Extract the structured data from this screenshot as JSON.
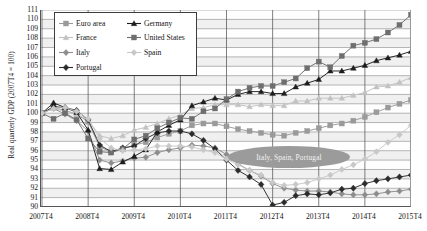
{
  "chart_data": {
    "type": "line",
    "title": "",
    "xlabel": "",
    "ylabel": "Real quarterly GDP (2007T4 = 100)",
    "ylim": [
      90,
      111
    ],
    "ytick_labels": [
      "90",
      "91",
      "92",
      "93",
      "94",
      "95",
      "96",
      "97",
      "98",
      "99",
      "100",
      "101",
      "102",
      "103",
      "104",
      "105",
      "106",
      "107",
      "108",
      "109",
      "110",
      "111"
    ],
    "xtick_labels": [
      "2007T4",
      "2008T4",
      "2009T4",
      "2010T4",
      "2011T4",
      "2012T4",
      "2013T4",
      "2014T4",
      "2015T4"
    ],
    "x_start_label": "2007T4",
    "x_end_label": "2015T4",
    "grid": true,
    "legend_position": "top-left-inside",
    "x_quarters": [
      "2007T4",
      "2008T1",
      "2008T2",
      "2008T3",
      "2008T4",
      "2009T1",
      "2009T2",
      "2009T3",
      "2009T4",
      "2010T1",
      "2010T2",
      "2010T3",
      "2010T4",
      "2011T1",
      "2011T2",
      "2011T3",
      "2011T4",
      "2012T1",
      "2012T2",
      "2012T3",
      "2012T4",
      "2013T1",
      "2013T2",
      "2013T3",
      "2013T4",
      "2014T1",
      "2014T2",
      "2014T3",
      "2014T4",
      "2015T1",
      "2015T2",
      "2015T3",
      "2015T4"
    ],
    "series": [
      {
        "name": "Euro area",
        "color": "#9a9a9a",
        "marker": "square",
        "values": [
          100.0,
          100.6,
          100.3,
          99.9,
          99.1,
          96.4,
          95.9,
          96.2,
          96.6,
          96.9,
          97.4,
          97.8,
          98.1,
          98.7,
          98.9,
          98.9,
          98.6,
          98.3,
          98.1,
          97.9,
          97.7,
          97.6,
          97.9,
          98.1,
          98.4,
          98.7,
          98.9,
          99.2,
          99.6,
          100.1,
          100.6,
          101.0,
          101.4
        ]
      },
      {
        "name": "France",
        "color": "#c2c2c2",
        "marker": "triangle",
        "values": [
          100.0,
          100.5,
          100.2,
          99.9,
          99.3,
          97.6,
          97.3,
          97.6,
          98.2,
          98.5,
          98.9,
          99.4,
          99.8,
          100.5,
          100.6,
          100.9,
          100.9,
          100.9,
          100.7,
          100.9,
          100.8,
          100.8,
          101.3,
          101.3,
          101.6,
          101.6,
          101.6,
          101.9,
          102.2,
          102.8,
          102.9,
          103.3,
          103.8
        ]
      },
      {
        "name": "Italy",
        "color": "#8d8d8d",
        "marker": "diamond",
        "values": [
          100.0,
          100.5,
          99.9,
          99.2,
          98.1,
          95.0,
          94.7,
          94.9,
          95.2,
          95.3,
          95.8,
          96.1,
          96.3,
          96.6,
          96.5,
          96.3,
          95.6,
          94.6,
          93.9,
          93.3,
          92.5,
          92.0,
          91.8,
          91.7,
          91.7,
          91.6,
          91.4,
          91.3,
          91.3,
          91.4,
          91.6,
          91.7,
          91.9
        ]
      },
      {
        "name": "Portugal",
        "color": "#2b2b2b",
        "marker": "diamond",
        "values": [
          100.0,
          100.7,
          100.6,
          100.3,
          99.3,
          96.6,
          95.9,
          96.3,
          96.5,
          97.3,
          97.9,
          98.1,
          98.1,
          97.8,
          97.1,
          96.2,
          95.0,
          93.9,
          93.2,
          92.4,
          90.2,
          90.5,
          91.2,
          91.4,
          91.3,
          91.5,
          91.9,
          92.0,
          92.5,
          92.8,
          93.0,
          93.2,
          93.4
        ]
      },
      {
        "name": "Germany",
        "color": "#1d1d1d",
        "marker": "triangle",
        "values": [
          100.0,
          101.1,
          100.6,
          100.1,
          98.2,
          94.1,
          94.0,
          94.8,
          95.4,
          96.1,
          98.0,
          98.7,
          99.3,
          100.8,
          101.2,
          101.6,
          101.4,
          102.0,
          102.3,
          102.3,
          102.1,
          102.1,
          102.8,
          103.2,
          103.6,
          104.5,
          104.5,
          104.8,
          105.1,
          105.6,
          105.9,
          106.2,
          106.6
        ]
      },
      {
        "name": "United States",
        "color": "#6e6e6e",
        "marker": "square",
        "values": [
          100.0,
          99.4,
          100.0,
          99.3,
          97.3,
          95.9,
          95.8,
          96.2,
          97.2,
          97.6,
          98.4,
          99.0,
          99.5,
          99.4,
          100.2,
          100.5,
          101.5,
          102.3,
          102.7,
          102.9,
          102.9,
          103.3,
          103.7,
          104.8,
          105.5,
          104.9,
          106.1,
          107.2,
          107.5,
          107.9,
          108.6,
          109.4,
          110.5
        ]
      },
      {
        "name": "Spain",
        "color": "#c8c8c8",
        "marker": "diamond",
        "values": [
          100.0,
          100.5,
          100.6,
          100.2,
          99.4,
          97.3,
          96.3,
          96.0,
          96.1,
          96.2,
          96.5,
          96.5,
          96.5,
          96.4,
          96.1,
          95.8,
          95.1,
          94.5,
          93.9,
          93.4,
          92.6,
          92.3,
          92.4,
          92.6,
          93.0,
          93.4,
          94.0,
          94.5,
          95.1,
          95.9,
          96.9,
          97.7,
          98.7
        ]
      }
    ],
    "annotations": [
      {
        "text": "Italy, Spain, Portugal",
        "shape": "ellipse",
        "fill": "#9b9b9b",
        "text_color": "#f2f2f2"
      }
    ],
    "legend_entries": [
      {
        "label": "Euro area",
        "color": "#9a9a9a",
        "marker": "square"
      },
      {
        "label": "Germany",
        "color": "#1d1d1d",
        "marker": "triangle"
      },
      {
        "label": "France",
        "color": "#c2c2c2",
        "marker": "triangle"
      },
      {
        "label": "United States",
        "color": "#6e6e6e",
        "marker": "square"
      },
      {
        "label": "Italy",
        "color": "#8d8d8d",
        "marker": "diamond"
      },
      {
        "label": "Spain",
        "color": "#c8c8c8",
        "marker": "diamond"
      },
      {
        "label": "Portugal",
        "color": "#2b2b2b",
        "marker": "diamond"
      }
    ]
  }
}
